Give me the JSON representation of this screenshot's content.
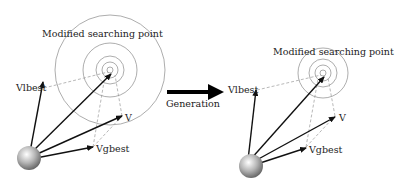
{
  "left_diagram": {
    "label_modified": "Modified searching point",
    "label_vlbest": "Vlbest",
    "label_v": "V",
    "label_vgbest": "Vgbest"
  },
  "transition": {
    "label": "Generation"
  },
  "right_diagram": {
    "label_modified": "Modified searching point",
    "label_vlbest": "Vlbest",
    "label_v": "V",
    "label_vgbest": "Vgbest"
  },
  "colors": {
    "arrow": "#111111",
    "circle": "#888888",
    "dashed": "#999999"
  }
}
